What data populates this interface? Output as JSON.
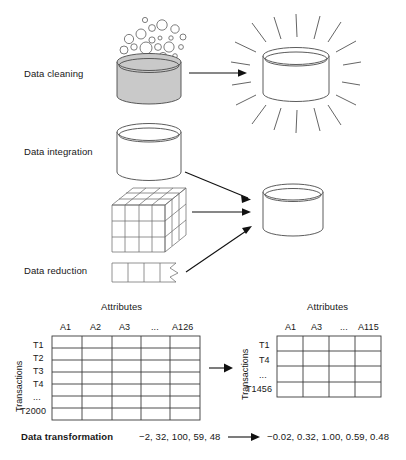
{
  "figure": {
    "type": "diagram"
  },
  "stages": {
    "cleaning": {
      "label": "Data cleaning",
      "source_icon": "dirty-database-cylinder-with-bubbles",
      "result_icon": "shiny-database-cylinder"
    },
    "integration": {
      "label": "Data integration",
      "icon": "database-cylinder"
    },
    "cube": {
      "icon": "data-cube"
    },
    "reduction": {
      "label": "Data reduction",
      "icon": "torn-data-strip"
    },
    "target": {
      "icon": "database-cylinder"
    }
  },
  "tables": {
    "left": {
      "attributes_label": "Attributes",
      "transactions_label": "Transactions",
      "columns": [
        "A1",
        "A2",
        "A3",
        "...",
        "A126"
      ],
      "rows": [
        "T1",
        "T2",
        "T3",
        "T4",
        "...",
        "T2000"
      ]
    },
    "right": {
      "attributes_label": "Attributes",
      "transactions_label": "Transactions",
      "columns": [
        "A1",
        "A3",
        "...",
        "A115"
      ],
      "rows": [
        "T1",
        "T4",
        "...",
        "T1456"
      ]
    }
  },
  "transformation": {
    "label": "Data transformation",
    "before": "−2, 32, 100, 59, 48",
    "after": "−0.02, 0.32, 1.00, 0.59, 0.48"
  },
  "colors": {
    "line": "#4a4a4a",
    "dark_line": "#2e2e2e",
    "dirty_fill": "#c9c9c9",
    "text": "#171717",
    "background": "#ffffff"
  }
}
